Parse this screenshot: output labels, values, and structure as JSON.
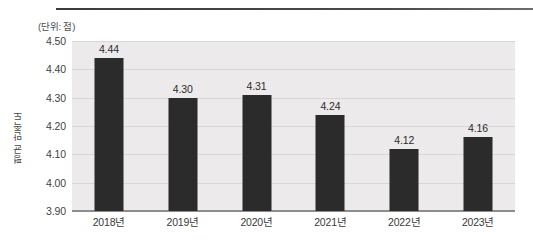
{
  "chart_data": {
    "type": "bar",
    "title": "",
    "subtitle": "",
    "unit_label": "(단위: 점)",
    "xlabel": "",
    "ylabel": "평균 만족도",
    "categories": [
      "2018년",
      "2019년",
      "2020년",
      "2021년",
      "2022년",
      "2023년"
    ],
    "values": [
      4.44,
      4.3,
      4.31,
      4.24,
      4.12,
      4.16
    ],
    "value_labels": [
      "4.44",
      "4.30",
      "4.31",
      "4.24",
      "4.12",
      "4.16"
    ],
    "ylim": [
      3.9,
      4.5
    ],
    "yticks": [
      4.5,
      4.4,
      4.3,
      4.2,
      4.1,
      4.0,
      3.9
    ],
    "ytick_labels": [
      "4.50",
      "4.40",
      "4.30",
      "4.20",
      "4.10",
      "4.00",
      "3.90"
    ],
    "grid": true,
    "legend": null,
    "legend_position": "none",
    "series": [
      {
        "name": "평균 만족도",
        "values": [
          4.44,
          4.3,
          4.31,
          4.24,
          4.12,
          4.16
        ]
      }
    ],
    "colors": {
      "bar": "#2b2b2b",
      "plot_background": "#eceaea",
      "gridline": "#d8d6d6",
      "axis": "#8d8d8d",
      "text": "#3a3a3a",
      "page_background": "#ffffff"
    }
  }
}
